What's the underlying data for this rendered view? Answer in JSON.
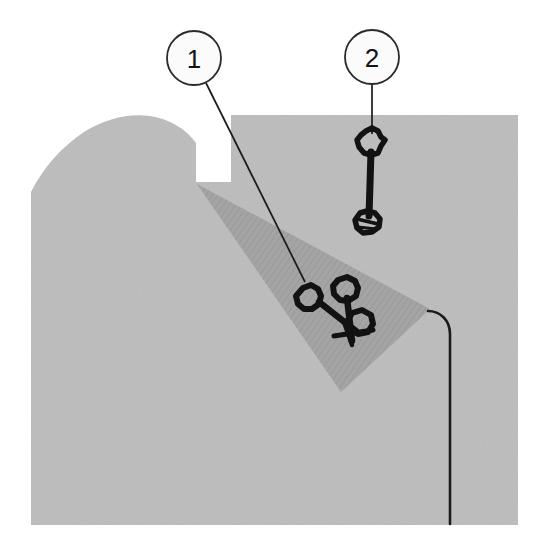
{
  "figure": {
    "type": "technical-cross-section-illustration",
    "title": "",
    "background_color": "#ffffff",
    "drawing_area": {
      "x": 31,
      "y": 115,
      "width": 487,
      "height": 410
    },
    "colors": {
      "body_gray": "#bcbcbc",
      "section_wedge_gray": "#a3a3a3",
      "hatch_line": "#8f8f8f",
      "outline_black": "#141414",
      "callout_fill": "#fbfbfb",
      "callout_stroke": "#2a2a2a",
      "leader_line": "#1a1a1a"
    },
    "callouts": [
      {
        "id": "callout-1",
        "label": "1",
        "circle": {
          "cx": 194,
          "cy": 58,
          "r": 27
        },
        "leader_start": {
          "x": 207,
          "y": 82
        },
        "leader_end": {
          "x": 305,
          "y": 281
        },
        "points_to": "lower-fastener-assembly"
      },
      {
        "id": "callout-2",
        "label": "2",
        "circle": {
          "cx": 372,
          "cy": 57,
          "r": 27
        },
        "leader_start": {
          "x": 372,
          "y": 84
        },
        "leader_end": {
          "x": 372,
          "y": 133
        },
        "points_to": "upper-fastener-assembly"
      }
    ],
    "fasteners": [
      {
        "id": "upper-fastener",
        "label_ref": "2",
        "head": {
          "cx": 371,
          "cy": 143,
          "r": 12
        },
        "shank": {
          "x1": 371,
          "y1": 155,
          "x2": 371,
          "y2": 212
        },
        "nut": {
          "cx": 369,
          "cy": 222,
          "r": 11
        }
      },
      {
        "id": "lower-fastener-left",
        "label_ref": "1",
        "head": {
          "cx": 310,
          "cy": 299,
          "r": 12
        },
        "shank": {
          "x1": 318,
          "y1": 307,
          "x2": 352,
          "y2": 333
        },
        "nut": {
          "cx": 358,
          "cy": 337,
          "r": 9
        }
      },
      {
        "id": "lower-fastener-right",
        "label_ref": "1",
        "head": {
          "cx": 345,
          "cy": 291,
          "r": 12
        },
        "shank": {
          "x1": 347,
          "y1": 301,
          "x2": 356,
          "y2": 330
        },
        "nut": {
          "cx": 361,
          "cy": 322,
          "r": 10
        }
      }
    ],
    "edge_line": {
      "id": "right-edge-line",
      "description": "thin vertical edge line with rounded top",
      "path_start": {
        "x": 429,
        "y": 311
      },
      "path_end": {
        "x": 450,
        "y": 524
      }
    },
    "section_wedge": {
      "id": "section-wedge",
      "description": "hatched diagonal sectioned wedge",
      "apex": {
        "x": 196,
        "y": 185
      },
      "right_point": {
        "x": 430,
        "y": 310
      },
      "bottom_tip": {
        "x": 341,
        "y": 391
      }
    }
  }
}
